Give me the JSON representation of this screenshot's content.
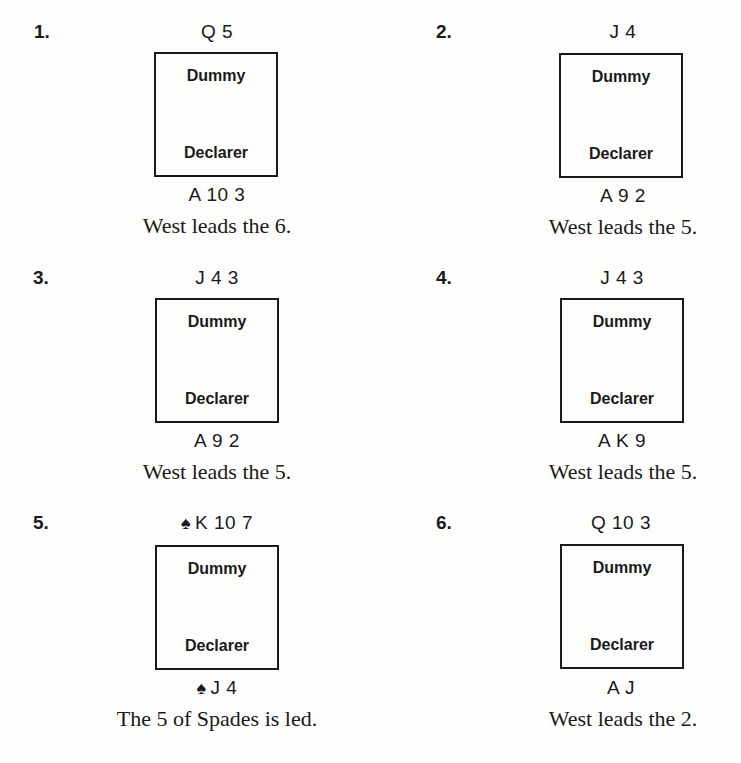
{
  "problems": [
    {
      "number": "1.",
      "dummy_holding": "Q 5",
      "declarer_holding": "A 10 3",
      "dummy_label": "Dummy",
      "declarer_label": "Declarer",
      "dummy_suit_icon": "",
      "declarer_suit_icon": "",
      "caption": "West leads the 6."
    },
    {
      "number": "2.",
      "dummy_holding": "J 4",
      "declarer_holding": "A 9 2",
      "dummy_label": "Dummy",
      "declarer_label": "Declarer",
      "dummy_suit_icon": "",
      "declarer_suit_icon": "",
      "caption": "West leads the 5."
    },
    {
      "number": "3.",
      "dummy_holding": "J 4 3",
      "declarer_holding": "A 9 2",
      "dummy_label": "Dummy",
      "declarer_label": "Declarer",
      "dummy_suit_icon": "",
      "declarer_suit_icon": "",
      "caption": "West leads the 5."
    },
    {
      "number": "4.",
      "dummy_holding": "J 4 3",
      "declarer_holding": "A K 9",
      "dummy_label": "Dummy",
      "declarer_label": "Declarer",
      "dummy_suit_icon": "",
      "declarer_suit_icon": "",
      "caption": "West leads the 5."
    },
    {
      "number": "5.",
      "dummy_holding": "K 10 7",
      "declarer_holding": "J 4",
      "dummy_label": "Dummy",
      "declarer_label": "Declarer",
      "dummy_suit_icon": "♠",
      "declarer_suit_icon": "♠",
      "caption": "The 5 of Spades is led."
    },
    {
      "number": "6.",
      "dummy_holding": "Q 10 3",
      "declarer_holding": "A J",
      "dummy_label": "Dummy",
      "declarer_label": "Declarer",
      "dummy_suit_icon": "",
      "declarer_suit_icon": "",
      "caption": "West leads the 2."
    }
  ]
}
